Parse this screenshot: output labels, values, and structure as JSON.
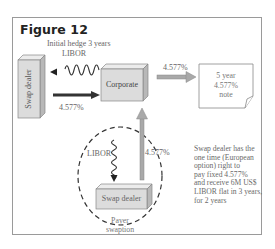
{
  "figure": {
    "title": "Figure 12",
    "caption_top": "Initial hedge 3 years",
    "nodes": {
      "swap_dealer_top": "Swap dealer",
      "corporate": "Corporate",
      "note": "5 year\n4.577%\nnote",
      "swap_dealer_bottom": "Swap dealer"
    },
    "flows": {
      "libor_to_dealer": "LIBOR",
      "fixed_to_corporate": "4.577%",
      "corporate_to_note": "4.577%",
      "libor_swaption": "LIBOR",
      "fixed_swaption": "4.577%"
    },
    "swaption_label": "Payer\nswaption",
    "description": "Swap dealer has the\none time (European\noption) right to\npay fixed 4.577%\nand receive 6M US$\nLIBOR flat in 3 years,\nfor 2 years"
  },
  "colors": {
    "box_fill": "#dcdcdc",
    "box_side": "#b8b8b8",
    "box_top": "#ececec",
    "arrow_dark": "#333333",
    "arrow_grey": "#a9a9a9",
    "border": "#9a9a9a"
  }
}
